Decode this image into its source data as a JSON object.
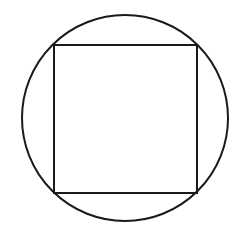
{
  "diagram": {
    "stroke_color": "#1a1a1a",
    "background": "#ffffff",
    "circle": {
      "cx": 125,
      "cy": 118,
      "r": 103,
      "stroke_width": 2
    },
    "square": {
      "x": 54,
      "y": 45,
      "width": 143,
      "height": 148,
      "stroke_width": 2
    }
  }
}
